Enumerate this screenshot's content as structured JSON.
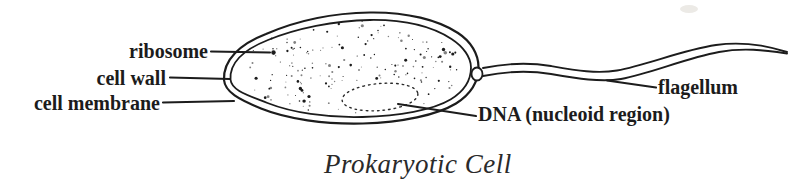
{
  "figure": {
    "caption": "Prokaryotic Cell",
    "labels": {
      "ribosome": "ribosome",
      "cell_wall": "cell wall",
      "cell_membrane": "cell membrane",
      "flagellum": "flagellum",
      "dna_nucleoid": "DNA (nucleoid region)"
    },
    "colors": {
      "ink": "#1c1c1c",
      "paper": "#ffffff"
    }
  }
}
